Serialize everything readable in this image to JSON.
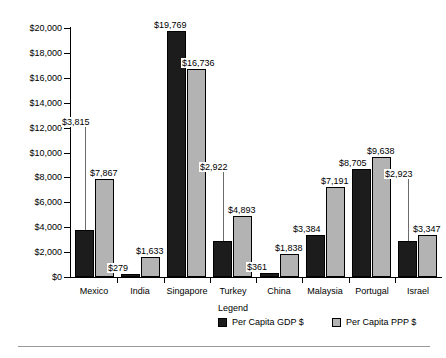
{
  "chart_data": {
    "type": "bar",
    "title": "",
    "xlabel": "",
    "ylabel": "",
    "ylim": [
      0,
      20000
    ],
    "grid": false,
    "legend_position": "bottom-right",
    "legend_title": "Legend",
    "y_ticks": [
      "$0",
      "$2,000",
      "$4,000",
      "$6,000",
      "$8,000",
      "$10,000",
      "$12,000",
      "$14,000",
      "$16,000",
      "$18,000",
      "$20,000"
    ],
    "y_tick_values": [
      0,
      2000,
      4000,
      6000,
      8000,
      10000,
      12000,
      14000,
      16000,
      18000,
      20000
    ],
    "categories": [
      "Mexico",
      "India",
      "Singapore",
      "Turkey",
      "China",
      "Malaysia",
      "Portugal",
      "Israel"
    ],
    "series": [
      {
        "name": "Per Capita GDP $",
        "color": "#1c1c1c",
        "values": [
          3815,
          279,
          19769,
          2922,
          361,
          3384,
          8705,
          2923
        ],
        "labels": [
          "$3,815",
          "$279",
          "$19,769",
          "$2,922",
          "$361",
          "$3,384",
          "$8,705",
          "$2,923"
        ]
      },
      {
        "name": "Per Capita PPP $",
        "color": "#b3b3b3",
        "values": [
          7867,
          1633,
          16736,
          4893,
          1838,
          7191,
          9638,
          3347
        ],
        "labels": [
          "$7,867",
          "$1,633",
          "$16,736",
          "$4,893",
          "$1,838",
          "$7,191",
          "$9,638",
          "$3,347"
        ]
      }
    ]
  }
}
